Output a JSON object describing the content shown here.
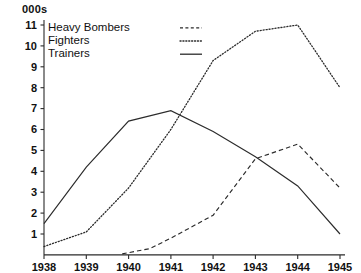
{
  "chart_data": {
    "type": "line",
    "title": "",
    "unit_label": "000s",
    "xlabel": "",
    "ylabel": "",
    "categories": [
      "1938",
      "1939",
      "1940",
      "1941",
      "1942",
      "1943",
      "1944",
      "1945"
    ],
    "x": [
      1938,
      1939,
      1940,
      1941,
      1942,
      1943,
      1944,
      1945
    ],
    "xlim": [
      1938,
      1945
    ],
    "ylim": [
      0,
      11.4
    ],
    "yticks": [
      1,
      2,
      3,
      4,
      5,
      6,
      7,
      8,
      9,
      10,
      11
    ],
    "ytick_labels": [
      "1",
      "2",
      "3",
      "4",
      "5",
      "6",
      "7",
      "8",
      "9",
      "10",
      "11"
    ],
    "grid": false,
    "legend_position": "top-left",
    "series": [
      {
        "name": "Heavy Bombers",
        "style": "dashed",
        "values": [
          null,
          null,
          0.05,
          0.3,
          0.8,
          1.9,
          4.6,
          5.3,
          3.2
        ],
        "x_values": [
          1938,
          1939,
          1939.85,
          1940.5,
          1941,
          1942,
          1943,
          1944,
          1945
        ]
      },
      {
        "name": "Fighters",
        "style": "dotted",
        "values": [
          0.4,
          1.1,
          3.2,
          6.0,
          9.3,
          10.7,
          11.0,
          8.0
        ]
      },
      {
        "name": "Trainers",
        "style": "solid",
        "values": [
          1.5,
          4.2,
          6.4,
          6.9,
          5.9,
          4.7,
          3.3,
          1.0
        ]
      }
    ]
  },
  "legend": {
    "items": [
      {
        "label": "Heavy Bombers",
        "style": "dashed"
      },
      {
        "label": "Fighters",
        "style": "dotted"
      },
      {
        "label": "Trainers",
        "style": "solid"
      }
    ]
  },
  "axes": {
    "y_unit": "000s"
  }
}
